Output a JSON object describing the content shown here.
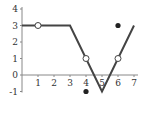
{
  "chart_data": {
    "type": "line",
    "title": "",
    "xlabel": "",
    "ylabel": "",
    "xlim": [
      0,
      7
    ],
    "ylim": [
      -1,
      4
    ],
    "grid": false,
    "x_ticks": [
      "1",
      "2",
      "3",
      "4",
      "5",
      "6",
      "7"
    ],
    "y_ticks": [
      "-1",
      "0",
      "1",
      "2",
      "3",
      "4"
    ],
    "series": [
      {
        "name": "f(x)",
        "x": [
          0,
          3,
          5,
          7
        ],
        "y": [
          3,
          3,
          -1,
          3
        ]
      }
    ],
    "open_points": [
      {
        "x": 1,
        "y": 3
      },
      {
        "x": 4,
        "y": 1
      },
      {
        "x": 6,
        "y": 1
      }
    ],
    "filled_points": [
      {
        "x": 4,
        "y": -1
      },
      {
        "x": 6,
        "y": 3
      }
    ],
    "colors": {
      "line": "#444444",
      "axis": "#888888",
      "point": "#222222"
    }
  }
}
